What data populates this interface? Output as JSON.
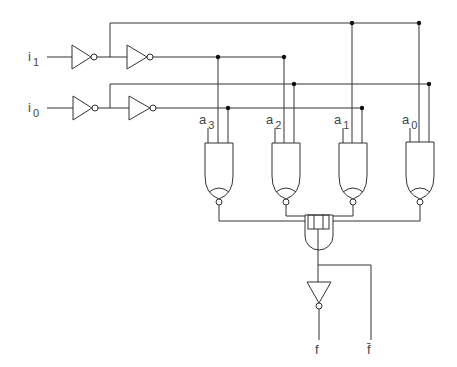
{
  "diagram": {
    "type": "logic-circuit",
    "inputs": [
      {
        "id": "i1",
        "label": "i",
        "sub": "1"
      },
      {
        "id": "i0",
        "label": "i",
        "sub": "0"
      }
    ],
    "data_inputs": [
      {
        "id": "a3",
        "label": "a",
        "sub": "3"
      },
      {
        "id": "a2",
        "label": "a",
        "sub": "2"
      },
      {
        "id": "a1",
        "label": "a",
        "sub": "1"
      },
      {
        "id": "a0",
        "label": "a",
        "sub": "0"
      }
    ],
    "outputs": [
      {
        "id": "f",
        "label": "f"
      },
      {
        "id": "f_bar",
        "label": "f̄"
      }
    ],
    "gates": {
      "inverters": 5,
      "and_gates_with_inverted_output": 4,
      "output_gate": "AND (4-input)"
    },
    "colors": {
      "line": "#333333",
      "background": "#ffffff"
    }
  }
}
